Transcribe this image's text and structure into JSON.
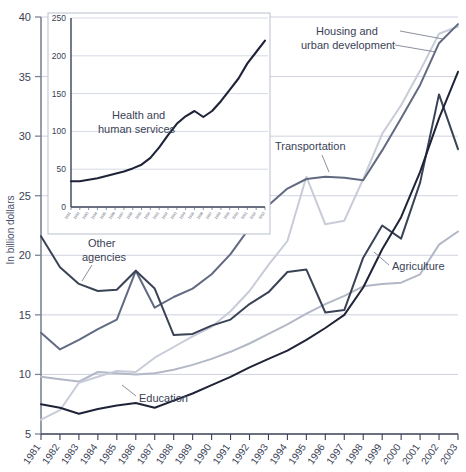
{
  "figure": {
    "ylabel": "In billion dollars"
  },
  "chart_data": {
    "type": "line",
    "title": "",
    "xlabel": "",
    "ylabel": "In billion dollars",
    "ylim": [
      5,
      40
    ],
    "yticks": [
      5,
      10,
      15,
      20,
      25,
      30,
      35,
      40
    ],
    "grid": true,
    "legend_position": "inline-annotations",
    "categories": [
      "1981",
      "1982",
      "1983",
      "1984",
      "1985",
      "1986",
      "1987",
      "1988",
      "1989",
      "1990",
      "1991",
      "1992",
      "1993",
      "1994",
      "1995",
      "1996",
      "1997",
      "1998",
      "1999",
      "2000",
      "2001",
      "2002",
      "2003"
    ],
    "series": [
      {
        "name": "Other agencies",
        "color": "#3a4256",
        "values": [
          21.6,
          19.0,
          17.6,
          17.0,
          17.1,
          18.7,
          17.2,
          13.3,
          13.4,
          14.1,
          14.6,
          15.9,
          16.9,
          18.6,
          18.8,
          15.2,
          15.4,
          19.8,
          22.5,
          21.4,
          26.1,
          33.5,
          28.9
        ]
      },
      {
        "name": "Transportation",
        "color": "#626a82",
        "values": [
          13.5,
          12.1,
          12.9,
          13.8,
          14.6,
          18.7,
          15.6,
          16.5,
          17.2,
          18.4,
          20.1,
          22.3,
          24.2,
          25.6,
          26.4,
          26.6,
          26.5,
          26.3,
          28.8,
          31.5,
          34.3,
          37.8,
          39.4
        ]
      },
      {
        "name": "Housing and urban development",
        "color": "#c8ccd8",
        "values": [
          6.2,
          7.0,
          9.3,
          9.8,
          10.3,
          10.2,
          11.4,
          12.3,
          13.2,
          14.0,
          15.3,
          17.0,
          19.2,
          21.2,
          26.6,
          22.6,
          22.9,
          26.4,
          30.2,
          32.6,
          35.5,
          38.6,
          39.2
        ]
      },
      {
        "name": "Agriculture",
        "color": "#b3b8c7",
        "values": [
          9.8,
          9.6,
          9.4,
          10.2,
          10.1,
          10.0,
          10.1,
          10.4,
          10.8,
          11.3,
          11.9,
          12.6,
          13.4,
          14.2,
          15.1,
          15.9,
          16.6,
          17.4,
          17.6,
          17.7,
          18.4,
          20.9,
          22.0
        ]
      },
      {
        "name": "Education",
        "color": "#1e2338",
        "values": [
          7.5,
          7.2,
          6.7,
          7.1,
          7.4,
          7.6,
          7.2,
          7.8,
          8.4,
          9.1,
          9.8,
          10.6,
          11.3,
          12.0,
          12.9,
          13.9,
          15.0,
          17.3,
          20.5,
          23.2,
          27.0,
          31.5,
          35.4
        ]
      }
    ],
    "annotations": [
      {
        "name": "Other agencies",
        "label": "Other\nagencies"
      },
      {
        "name": "Transportation",
        "label": "Transportation"
      },
      {
        "name": "Housing and urban development",
        "label": "Housing and\nurban development"
      },
      {
        "name": "Agriculture",
        "label": "Agriculture"
      },
      {
        "name": "Education",
        "label": "Education"
      }
    ],
    "inset": {
      "type": "line",
      "title": "",
      "ylim": [
        0,
        250
      ],
      "yticks": [
        0,
        50,
        100,
        150,
        200,
        250
      ],
      "grid": true,
      "series_name": "Health and human services",
      "label": "Health and\nhuman services",
      "color": "#1e2338",
      "categories": [
        "1981",
        "1982",
        "1983",
        "1984",
        "1985",
        "1986",
        "1987",
        "1988",
        "1989",
        "1990",
        "1991",
        "1992",
        "1993",
        "1994",
        "1995",
        "1996",
        "1997",
        "1998",
        "1999",
        "2000",
        "2001",
        "2002",
        "2003"
      ],
      "values": [
        34,
        34,
        36,
        38,
        41,
        44,
        47,
        51,
        56,
        65,
        79,
        95,
        110,
        120,
        127,
        119,
        127,
        140,
        155,
        170,
        190,
        205,
        220
      ]
    }
  },
  "labels": {
    "other_agencies_l1": "Other",
    "other_agencies_l2": "agencies",
    "transportation": "Transportation",
    "hud_l1": "Housing and",
    "hud_l2": "urban development",
    "agriculture": "Agriculture",
    "education": "Education",
    "inset_l1": "Health and",
    "inset_l2": "human services"
  },
  "ticks": {
    "main_y": [
      "40",
      "35",
      "30",
      "25",
      "20",
      "15",
      "10",
      "5"
    ],
    "main_x": [
      "1981",
      "1982",
      "1983",
      "1984",
      "1985",
      "1986",
      "1987",
      "1988",
      "1989",
      "1990",
      "1991",
      "1992",
      "1993",
      "1994",
      "1995",
      "1996",
      "1997",
      "1998",
      "1999",
      "2000",
      "2001",
      "2002",
      "2003"
    ],
    "inset_y": [
      "250",
      "200",
      "150",
      "100",
      "50",
      "0"
    ],
    "inset_x": [
      "1981",
      "1982",
      "1983",
      "1984",
      "1985",
      "1986",
      "1987",
      "1988",
      "1989",
      "1990",
      "1991",
      "1992",
      "1993",
      "1994",
      "1995",
      "1996",
      "1997",
      "1998",
      "1999",
      "2000",
      "2001",
      "2002",
      "2003"
    ]
  }
}
